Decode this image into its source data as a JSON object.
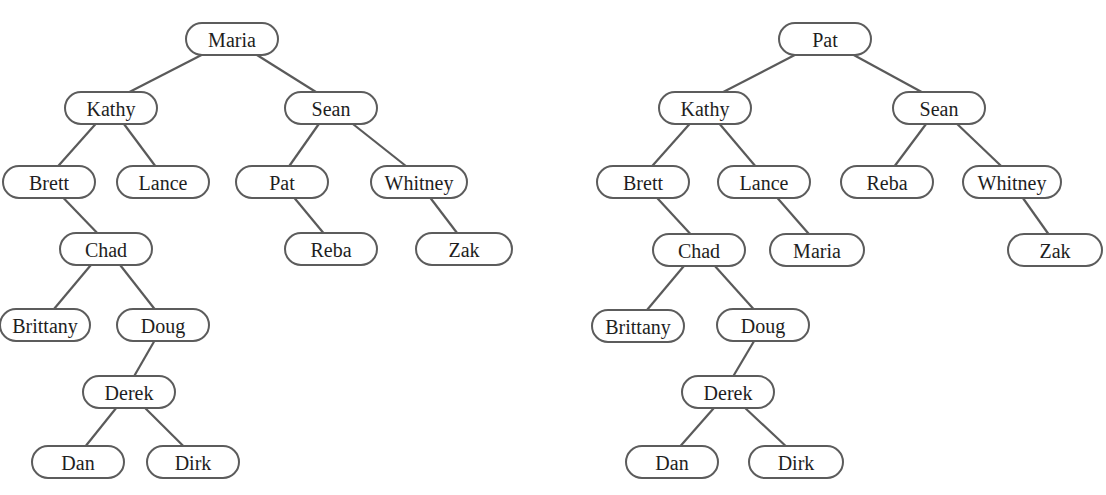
{
  "trees": [
    {
      "name": "left-tree",
      "root": "Maria",
      "nodes": [
        {
          "id": "Maria",
          "label": "Maria",
          "x": 232,
          "y": 39,
          "w": 92
        },
        {
          "id": "Kathy",
          "label": "Kathy",
          "x": 111,
          "y": 108,
          "w": 92
        },
        {
          "id": "Sean",
          "label": "Sean",
          "x": 331,
          "y": 108,
          "w": 92
        },
        {
          "id": "Brett",
          "label": "Brett",
          "x": 49,
          "y": 182,
          "w": 92
        },
        {
          "id": "Lance",
          "label": "Lance",
          "x": 163,
          "y": 182,
          "w": 92
        },
        {
          "id": "Pat",
          "label": "Pat",
          "x": 282,
          "y": 182,
          "w": 92
        },
        {
          "id": "Whitney",
          "label": "Whitney",
          "x": 419,
          "y": 182,
          "w": 96
        },
        {
          "id": "Chad",
          "label": "Chad",
          "x": 106,
          "y": 249,
          "w": 92
        },
        {
          "id": "Reba",
          "label": "Reba",
          "x": 331,
          "y": 249,
          "w": 92
        },
        {
          "id": "Zak",
          "label": "Zak",
          "x": 464,
          "y": 249,
          "w": 96
        },
        {
          "id": "Brittany",
          "label": "Brittany",
          "x": 45,
          "y": 325,
          "w": 90
        },
        {
          "id": "Doug",
          "label": "Doug",
          "x": 163,
          "y": 325,
          "w": 92
        },
        {
          "id": "Derek",
          "label": "Derek",
          "x": 129,
          "y": 392,
          "w": 92
        },
        {
          "id": "Dan",
          "label": "Dan",
          "x": 78,
          "y": 462,
          "w": 92
        },
        {
          "id": "Dirk",
          "label": "Dirk",
          "x": 193,
          "y": 462,
          "w": 92
        }
      ],
      "edges": [
        [
          "Maria",
          "Kathy"
        ],
        [
          "Maria",
          "Sean"
        ],
        [
          "Kathy",
          "Brett"
        ],
        [
          "Kathy",
          "Lance"
        ],
        [
          "Sean",
          "Pat"
        ],
        [
          "Sean",
          "Whitney"
        ],
        [
          "Brett",
          "Chad"
        ],
        [
          "Pat",
          "Reba"
        ],
        [
          "Whitney",
          "Zak"
        ],
        [
          "Chad",
          "Brittany"
        ],
        [
          "Chad",
          "Doug"
        ],
        [
          "Doug",
          "Derek"
        ],
        [
          "Derek",
          "Dan"
        ],
        [
          "Derek",
          "Dirk"
        ]
      ]
    },
    {
      "name": "right-tree",
      "root": "Pat",
      "nodes": [
        {
          "id": "Pat",
          "label": "Pat",
          "x": 825,
          "y": 39,
          "w": 92
        },
        {
          "id": "Kathy",
          "label": "Kathy",
          "x": 705,
          "y": 108,
          "w": 92
        },
        {
          "id": "Sean",
          "label": "Sean",
          "x": 939,
          "y": 108,
          "w": 92
        },
        {
          "id": "Brett",
          "label": "Brett",
          "x": 643,
          "y": 182,
          "w": 92
        },
        {
          "id": "Lance",
          "label": "Lance",
          "x": 764,
          "y": 182,
          "w": 92
        },
        {
          "id": "Reba",
          "label": "Reba",
          "x": 887,
          "y": 182,
          "w": 92
        },
        {
          "id": "Whitney",
          "label": "Whitney",
          "x": 1012,
          "y": 182,
          "w": 98
        },
        {
          "id": "Chad",
          "label": "Chad",
          "x": 699,
          "y": 250,
          "w": 92
        },
        {
          "id": "Maria",
          "label": "Maria",
          "x": 817,
          "y": 250,
          "w": 94
        },
        {
          "id": "Zak",
          "label": "Zak",
          "x": 1055,
          "y": 250,
          "w": 94
        },
        {
          "id": "Brittany",
          "label": "Brittany",
          "x": 638,
          "y": 326,
          "w": 92
        },
        {
          "id": "Doug",
          "label": "Doug",
          "x": 763,
          "y": 325,
          "w": 92
        },
        {
          "id": "Derek",
          "label": "Derek",
          "x": 728,
          "y": 392,
          "w": 92
        },
        {
          "id": "Dan",
          "label": "Dan",
          "x": 672,
          "y": 462,
          "w": 92
        },
        {
          "id": "Dirk",
          "label": "Dirk",
          "x": 796,
          "y": 462,
          "w": 94
        }
      ],
      "edges": [
        [
          "Pat",
          "Kathy"
        ],
        [
          "Pat",
          "Sean"
        ],
        [
          "Kathy",
          "Brett"
        ],
        [
          "Kathy",
          "Lance"
        ],
        [
          "Sean",
          "Reba"
        ],
        [
          "Sean",
          "Whitney"
        ],
        [
          "Brett",
          "Chad"
        ],
        [
          "Lance",
          "Maria"
        ],
        [
          "Whitney",
          "Zak"
        ],
        [
          "Chad",
          "Brittany"
        ],
        [
          "Chad",
          "Doug"
        ],
        [
          "Doug",
          "Derek"
        ],
        [
          "Derek",
          "Dan"
        ],
        [
          "Derek",
          "Dirk"
        ]
      ]
    }
  ],
  "style": {
    "node_height": 32,
    "stroke_color": "#5c5c5c",
    "text_color": "#1e1e1e",
    "background": "#ffffff"
  }
}
